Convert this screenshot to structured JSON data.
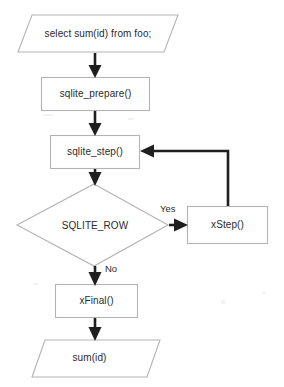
{
  "diagram": {
    "background_color": "#ffffff",
    "outline_color": "#b3b3b3",
    "connector_color": "#1f1f1f",
    "text_color": "#2b2b2b",
    "nodes": [
      {
        "id": "input-query",
        "shape": "parallelogram",
        "label": "select sum(id) from foo;"
      },
      {
        "id": "sqlite-prepare",
        "shape": "rectangle",
        "label": "sqlite_prepare()"
      },
      {
        "id": "sqlite-step",
        "shape": "rectangle",
        "label": "sqlite_step()"
      },
      {
        "id": "sqlite-row",
        "shape": "diamond",
        "label": "SQLITE_ROW"
      },
      {
        "id": "xstep",
        "shape": "rectangle",
        "label": "xStep()"
      },
      {
        "id": "xfinal",
        "shape": "rectangle",
        "label": "xFinal()"
      },
      {
        "id": "output-sum",
        "shape": "parallelogram",
        "label": "sum(id)"
      }
    ],
    "edges": [
      {
        "id": "e1",
        "from": "input-query",
        "to": "sqlite-prepare",
        "label": ""
      },
      {
        "id": "e2",
        "from": "sqlite-prepare",
        "to": "sqlite-step",
        "label": ""
      },
      {
        "id": "e3",
        "from": "sqlite-step",
        "to": "sqlite-row",
        "label": ""
      },
      {
        "id": "e4",
        "from": "sqlite-row",
        "to": "xstep",
        "label": "Yes"
      },
      {
        "id": "e5",
        "from": "xstep",
        "to": "sqlite-step",
        "label": ""
      },
      {
        "id": "e6",
        "from": "sqlite-row",
        "to": "xfinal",
        "label": "No"
      },
      {
        "id": "e7",
        "from": "xfinal",
        "to": "output-sum",
        "label": ""
      }
    ]
  }
}
